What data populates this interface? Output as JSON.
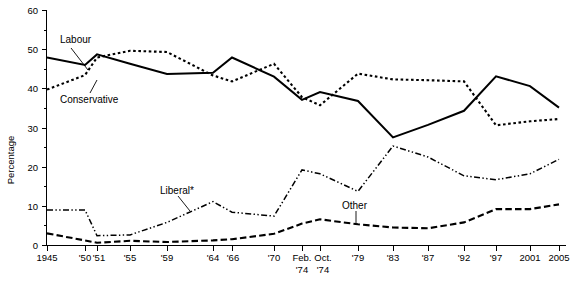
{
  "chart_data": {
    "type": "line",
    "title": "",
    "xlabel": "",
    "ylabel": "Percentage",
    "ylim": [
      0,
      60
    ],
    "yticks": [
      0,
      10,
      20,
      30,
      40,
      50,
      60
    ],
    "yticklabels": [
      "0",
      "10",
      "20",
      "30",
      "40",
      "50",
      "60"
    ],
    "y_minor_ticks": [
      5,
      15,
      25,
      35,
      45,
      55
    ],
    "grid": false,
    "legend_position": "inline-annotations",
    "categories": [
      "1945",
      "'50",
      "'51",
      "'55",
      "'59",
      "'64",
      "'66",
      "'70",
      "Feb. '74",
      "Oct. '74",
      "'79",
      "'83",
      "'87",
      "'92",
      "'97",
      "2001",
      "2005"
    ],
    "xticklabels": [
      "1945",
      "'50",
      "'51",
      "'55",
      "'59",
      "'64",
      "'66",
      "'70",
      "Feb.|'74",
      "Oct.|'74",
      "'79",
      "'83",
      "'87",
      "'92",
      "'97",
      "2001",
      "2005"
    ],
    "series": [
      {
        "name": "Labour",
        "style": "solid",
        "values": [
          48.0,
          46.1,
          48.8,
          46.4,
          43.8,
          44.1,
          48.0,
          43.1,
          37.2,
          39.2,
          36.9,
          27.6,
          30.8,
          34.4,
          43.2,
          40.7,
          35.2
        ]
      },
      {
        "name": "Conservative",
        "style": "dotted",
        "values": [
          39.8,
          43.5,
          48.0,
          49.7,
          49.4,
          43.4,
          41.9,
          46.4,
          37.9,
          35.8,
          43.9,
          42.4,
          42.2,
          41.9,
          30.7,
          31.7,
          32.3
        ]
      },
      {
        "name": "Liberal*",
        "style": "dash-dot",
        "values": [
          9.1,
          9.1,
          2.5,
          2.7,
          5.9,
          11.2,
          8.5,
          7.5,
          19.3,
          18.3,
          13.8,
          25.4,
          22.6,
          17.8,
          16.8,
          18.3,
          22.0
        ]
      },
      {
        "name": "Other",
        "style": "dashed",
        "values": [
          3.1,
          1.3,
          0.7,
          1.2,
          0.9,
          1.3,
          1.6,
          3.0,
          5.6,
          6.7,
          5.4,
          4.6,
          4.4,
          5.9,
          9.3,
          9.3,
          10.5
        ]
      }
    ],
    "annotations": [
      {
        "label": "Labour",
        "x": 60,
        "y": 43
      },
      {
        "label": "Conservative",
        "x": 60,
        "y": 99
      },
      {
        "label": "Liberal*",
        "x": 160,
        "y": 191
      },
      {
        "label": "Other",
        "x": 345,
        "y": 206
      }
    ]
  }
}
